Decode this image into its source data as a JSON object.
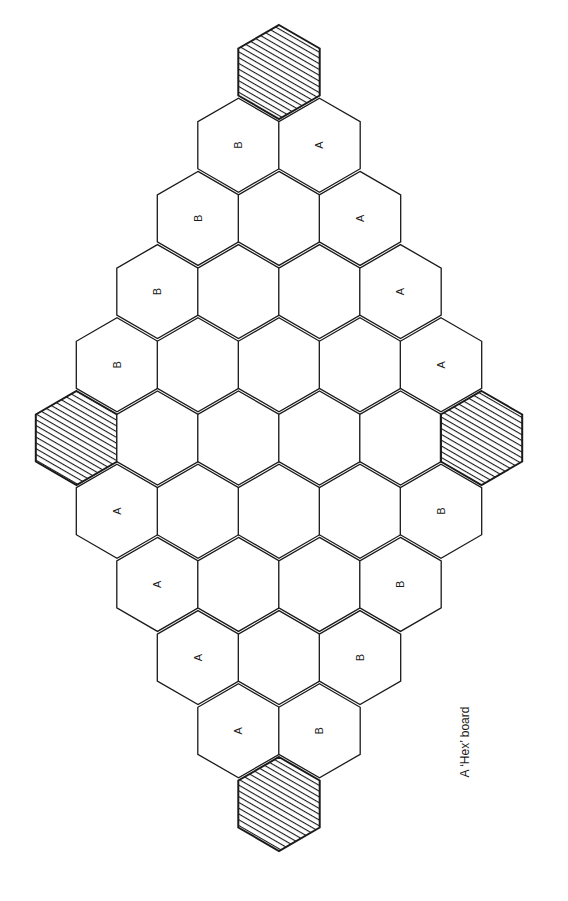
{
  "caption": "A ‘Hex’ board",
  "colors": {
    "stroke": "#1a1a1a",
    "background": "#ffffff",
    "hatch": "#1a1a1a"
  },
  "board": {
    "center_x": 279,
    "top_y": 72,
    "col_spacing": 81,
    "row_spacing": 73.2,
    "hex_radius": 47,
    "rows": [
      [
        "#"
      ],
      [
        "B",
        "A"
      ],
      [
        "B",
        "",
        "A"
      ],
      [
        "B",
        "",
        "",
        "A"
      ],
      [
        "B",
        "",
        "",
        "",
        "A"
      ],
      [
        "#",
        "",
        "",
        "",
        "",
        "#"
      ],
      [
        "A",
        "",
        "",
        "",
        "B"
      ],
      [
        "A",
        "",
        "",
        "B"
      ],
      [
        "A",
        "",
        "B"
      ],
      [
        "A",
        "B"
      ],
      [
        "#"
      ]
    ],
    "legend": {
      "#": "shaded corner cell",
      "A": "player A edge cell",
      "B": "player B edge cell"
    }
  }
}
